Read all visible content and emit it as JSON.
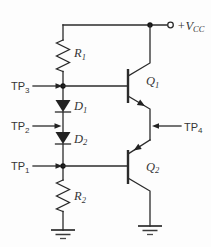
{
  "schematic": {
    "kind": "transistor-circuit-schematic",
    "description": "push-pull transistor stage with diode bias and test points",
    "colors": {
      "wire": "#2b2b2b",
      "symbol_fill": "#222222",
      "label_text": "#353535",
      "background": "#fdfdfd"
    },
    "power": {
      "prefix": "+V",
      "sub": "CC",
      "terminal": "open-circle"
    },
    "components": {
      "r1": {
        "prefix": "R",
        "sub": "1",
        "type": "resistor"
      },
      "r2": {
        "prefix": "R",
        "sub": "2",
        "type": "resistor"
      },
      "d1": {
        "prefix": "D",
        "sub": "1",
        "type": "diode"
      },
      "d2": {
        "prefix": "D",
        "sub": "2",
        "type": "diode"
      },
      "q1": {
        "prefix": "Q",
        "sub": "1",
        "type": "npn-transistor"
      },
      "q2": {
        "prefix": "Q",
        "sub": "2",
        "type": "pnp-transistor"
      }
    },
    "test_points": {
      "tp1": {
        "prefix": "TP",
        "sub": "1"
      },
      "tp2": {
        "prefix": "TP",
        "sub": "2"
      },
      "tp3": {
        "prefix": "TP",
        "sub": "3"
      },
      "tp4": {
        "prefix": "TP",
        "sub": "4"
      }
    },
    "ground_symbols": 2
  }
}
